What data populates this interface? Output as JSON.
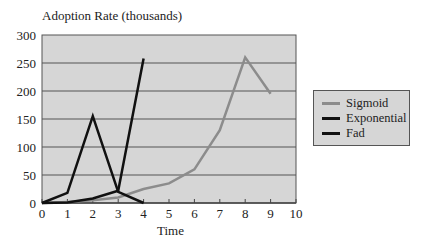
{
  "chart_data": {
    "type": "line",
    "title": "Adoption Rate (thousands)",
    "xlabel": "Time",
    "ylabel": "Adoption Rate (thousands)",
    "x": [
      0,
      1,
      2,
      3,
      4,
      5,
      6,
      7,
      8,
      9
    ],
    "xlim": [
      0,
      10
    ],
    "ylim": [
      0,
      300
    ],
    "xticks": [
      0,
      1,
      2,
      3,
      4,
      5,
      6,
      7,
      8,
      9,
      10
    ],
    "yticks": [
      0,
      50,
      100,
      150,
      200,
      250,
      300
    ],
    "grid": true,
    "legend_position": "right",
    "series": [
      {
        "name": "Sigmoid",
        "color": "#8c8c8c",
        "x": [
          0,
          1,
          2,
          3,
          4,
          5,
          6,
          7,
          8,
          9
        ],
        "values": [
          0,
          2,
          5,
          10,
          25,
          35,
          60,
          130,
          260,
          195
        ]
      },
      {
        "name": "Exponential",
        "color": "#111111",
        "x": [
          0,
          1,
          2,
          3,
          4
        ],
        "values": [
          0,
          1,
          8,
          22,
          258
        ]
      },
      {
        "name": "Fad",
        "color": "#111111",
        "x": [
          0,
          1,
          2,
          3,
          4
        ],
        "values": [
          0,
          18,
          155,
          20,
          0
        ]
      }
    ]
  }
}
